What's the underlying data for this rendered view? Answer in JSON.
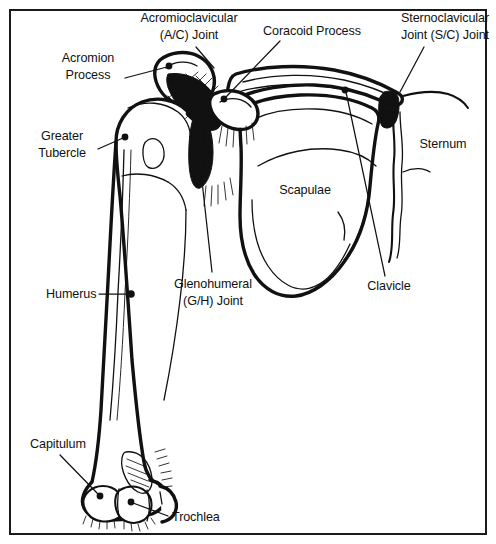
{
  "figure": {
    "frame_color": "#1a1a1a",
    "ink_color": "#111111",
    "background_color": "#ffffff"
  },
  "labels": [
    {
      "id": "acromioclavicular-joint",
      "lines": [
        "Acromioclavicular",
        "(A/C) Joint"
      ],
      "line1": "Acromioclavicular",
      "line2": "(A/C) Joint",
      "x": 189,
      "y": 22,
      "align": "middle",
      "leader": "M 196 47 L 214 68",
      "marker": "none"
    },
    {
      "id": "coracoid-process",
      "lines": [
        "Coracoid Process"
      ],
      "line1": "Coracoid Process",
      "line2": "",
      "x": 312,
      "y": 35,
      "align": "middle",
      "leader": "M 280 41 L 226 97",
      "marker": "dot",
      "marker_x": 224,
      "marker_y": 99
    },
    {
      "id": "sternoclavicular-joint",
      "lines": [
        "Sternoclavicular",
        "Joint (S/C) Joint"
      ],
      "line1": "Sternoclavicular",
      "line2": "Joint (S/C) Joint",
      "x": 445,
      "y": 22,
      "align": "middle",
      "leader": "M 424 47 L 400 92",
      "marker": "none"
    },
    {
      "id": "acromion-process",
      "lines": [
        "Acromion",
        "Process"
      ],
      "line1": "Acromion",
      "line2": "Process",
      "x": 88,
      "y": 62,
      "align": "middle",
      "leader": "M 125 78 L 167 67",
      "marker": "dot",
      "marker_x": 169,
      "marker_y": 66
    },
    {
      "id": "greater-tubercle",
      "lines": [
        "Greater",
        "Tubercle"
      ],
      "line1": "Greater",
      "line2": "Tubercle",
      "x": 62,
      "y": 140,
      "align": "middle",
      "leader": "M 98 149 L 123 138",
      "marker": "dot",
      "marker_x": 125,
      "marker_y": 137
    },
    {
      "id": "sternum",
      "lines": [
        "Sternum"
      ],
      "line1": "Sternum",
      "line2": "",
      "x": 443,
      "y": 148,
      "align": "middle",
      "leader": "none",
      "marker": "none"
    },
    {
      "id": "scapulae",
      "lines": [
        "Scapulae"
      ],
      "line1": "Scapulae",
      "line2": "",
      "x": 305,
      "y": 194,
      "align": "middle",
      "leader": "none",
      "marker": "none"
    },
    {
      "id": "glenohumeral-joint",
      "lines": [
        "Glenohumeral",
        "(G/H) Joint"
      ],
      "line1": "Glenohumeral",
      "line2": "(G/H) Joint",
      "x": 213,
      "y": 288,
      "align": "middle",
      "leader": "M 212 272 L 201 172",
      "marker": "none"
    },
    {
      "id": "humerus",
      "lines": [
        "Humerus"
      ],
      "line1": "Humerus",
      "line2": "",
      "x": 46,
      "y": 298,
      "align": "start",
      "leader": "M 99 294 L 129 294",
      "marker": "dot",
      "marker_x": 131,
      "marker_y": 294
    },
    {
      "id": "clavicle",
      "lines": [
        "Clavicle"
      ],
      "line1": "Clavicle",
      "line2": "",
      "x": 389,
      "y": 290,
      "align": "middle",
      "leader": "M 385 276 L 346 92",
      "marker": "dot",
      "marker_x": 345,
      "marker_y": 90
    },
    {
      "id": "capitulum",
      "lines": [
        "Capitulum"
      ],
      "line1": "Capitulum",
      "line2": "",
      "x": 30,
      "y": 448,
      "align": "start",
      "leader": "M 60 455 L 98 494",
      "marker": "dot",
      "marker_x": 100,
      "marker_y": 496
    },
    {
      "id": "trochlea",
      "lines": [
        "Trochlea"
      ],
      "line1": "Trochlea",
      "line2": "",
      "x": 172,
      "y": 521,
      "align": "start",
      "leader": "M 168 516 L 133 503",
      "marker": "dot",
      "marker_x": 131,
      "marker_y": 502
    }
  ],
  "structures": [
    {
      "id": "humerus-bone",
      "name": "Humerus"
    },
    {
      "id": "scapula-bone",
      "name": "Scapulae"
    },
    {
      "id": "clavicle-bone",
      "name": "Clavicle"
    },
    {
      "id": "sternum-bone",
      "name": "Sternum"
    },
    {
      "id": "acromion",
      "name": "Acromion Process"
    },
    {
      "id": "coracoid",
      "name": "Coracoid Process"
    },
    {
      "id": "greater-tubercle",
      "name": "Greater Tubercle"
    },
    {
      "id": "capitulum",
      "name": "Capitulum"
    },
    {
      "id": "trochlea",
      "name": "Trochlea"
    },
    {
      "id": "ac-joint",
      "name": "Acromioclavicular (A/C) Joint"
    },
    {
      "id": "gh-joint",
      "name": "Glenohumeral (G/H) Joint"
    },
    {
      "id": "sc-joint",
      "name": "Sternoclavicular (S/C) Joint"
    }
  ]
}
